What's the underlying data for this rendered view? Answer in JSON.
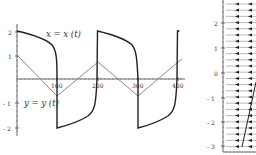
{
  "chart_data": [
    {
      "type": "line",
      "title": "",
      "xlabel": "",
      "ylabel": "",
      "xlim": [
        0,
        400
      ],
      "ylim": [
        -2.2,
        2.2
      ],
      "x_ticks": [
        "100",
        "200",
        "300",
        "400"
      ],
      "y_ticks": [
        "2",
        "1",
        "-1",
        "-2"
      ],
      "grid": false,
      "annotations": [
        "x = x (t)",
        "y = y (t)"
      ],
      "series": [
        {
          "name": "x = x (t)",
          "color": "#222222",
          "style": "relaxation square wave",
          "x": [
            0,
            30,
            60,
            80,
            95,
            100,
            100,
            120,
            160,
            185,
            198,
            200,
            200,
            230,
            260,
            280,
            295,
            300,
            300,
            330,
            360,
            385,
            398,
            400
          ],
          "y": [
            2.0,
            1.8,
            1.5,
            1.2,
            0.6,
            -0.5,
            -2.0,
            -1.8,
            -1.5,
            -1.2,
            -0.6,
            1.5,
            2.0,
            1.8,
            1.5,
            1.2,
            0.6,
            -0.5,
            -2.0,
            -1.8,
            -1.5,
            -1.2,
            -0.6,
            1.8
          ]
        },
        {
          "name": "y = y (t)",
          "color": "#888888",
          "style": "triangle wave",
          "x": [
            0,
            100,
            200,
            300,
            400
          ],
          "y": [
            1.0,
            -0.7,
            0.7,
            -0.7,
            0.7
          ]
        }
      ]
    },
    {
      "type": "direction_field",
      "title": "",
      "y_ticks": [
        "2",
        "1",
        "0",
        "-1",
        "-2",
        "-3"
      ],
      "ylim": [
        -3.2,
        2.7
      ],
      "arrow_direction": "left",
      "nullcline": {
        "from": [
          0.95,
          -2.9
        ],
        "to": [
          1.4,
          -0.5
        ]
      },
      "partially_cropped": true
    }
  ],
  "left_plot": {
    "label_x": "x = x (t)",
    "label_y": "y = y (t)",
    "xticks": [
      {
        "label": "100",
        "px": 57
      },
      {
        "label": "200",
        "px": 98
      },
      {
        "label": "300",
        "px": 138
      },
      {
        "label": "400",
        "px": 178
      }
    ],
    "yticks": [
      {
        "label": "2",
        "py": 32
      },
      {
        "label": "1",
        "py": 56
      },
      {
        "label": "- 1",
        "py": 103
      },
      {
        "label": "- 2",
        "py": 128
      }
    ]
  },
  "right_plot": {
    "yticks": [
      {
        "label": "2",
        "py": 23
      },
      {
        "label": "1",
        "py": 48
      },
      {
        "label": "0",
        "py": 73
      },
      {
        "label": "- 1",
        "py": 98
      },
      {
        "label": "- 2",
        "py": 122
      },
      {
        "label": "- 3",
        "py": 146
      }
    ]
  }
}
